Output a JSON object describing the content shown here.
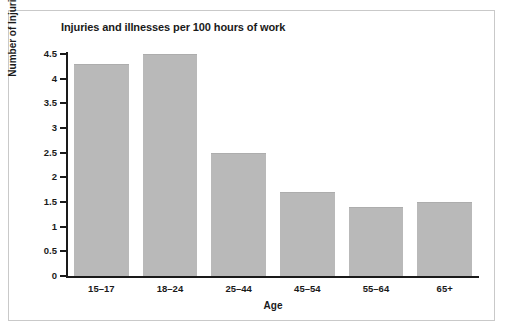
{
  "chart_data": {
    "type": "bar",
    "title": "Injuries and illnesses per 100 hours of work",
    "xlabel": "Age",
    "ylabel": "Number of Injuries/Illnesses",
    "categories": [
      "15–17",
      "18–24",
      "25–44",
      "45–54",
      "55–64",
      "65+"
    ],
    "values": [
      4.3,
      4.5,
      2.5,
      1.7,
      1.4,
      1.5
    ],
    "ylim": [
      0,
      4.5
    ],
    "yticks": [
      "0",
      "0.5",
      "1",
      "1.5",
      "2",
      "2.5",
      "3",
      "3.5",
      "4",
      "4.5"
    ],
    "ytick_values": [
      0,
      0.5,
      1,
      1.5,
      2,
      2.5,
      3,
      3.5,
      4,
      4.5
    ],
    "grid": false,
    "legend": "none",
    "bar_color": "#b9b9b9",
    "axis_color": "#1a1a1a",
    "frame_color": "#c9c9c9",
    "background": "#ffffff"
  }
}
